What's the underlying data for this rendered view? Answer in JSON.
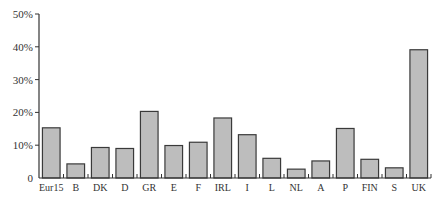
{
  "chart_data": {
    "type": "bar",
    "title": "",
    "xlabel": "",
    "ylabel": "",
    "ylim": [
      0,
      50
    ],
    "yticks": [
      0,
      10,
      20,
      30,
      40,
      50
    ],
    "ytick_labels": [
      "0",
      "10%",
      "20%",
      "30%",
      "40%",
      "50%"
    ],
    "grid": false,
    "legend": "none",
    "categories": [
      "Eur15",
      "B",
      "DK",
      "D",
      "GR",
      "E",
      "F",
      "IRL",
      "I",
      "L",
      "NL",
      "A",
      "P",
      "FIN",
      "S",
      "UK"
    ],
    "values": [
      15.3,
      4.3,
      9.3,
      9.0,
      20.3,
      9.9,
      10.9,
      18.3,
      13.2,
      6.0,
      2.7,
      5.2,
      15.1,
      5.7,
      3.1,
      39.1
    ],
    "unit": "%",
    "colors": {
      "bar_fill": "#bdbdbd",
      "bar_stroke": "#3a3a3a",
      "axis": "#333333"
    }
  }
}
